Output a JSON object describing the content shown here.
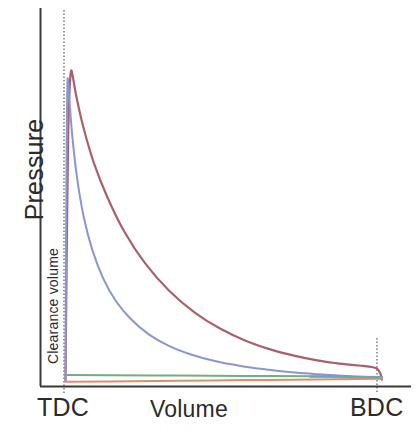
{
  "chart_data": {
    "type": "line",
    "title": "",
    "xlabel": "Volume",
    "ylabel": "Pressure",
    "grid": false,
    "legend": "none",
    "xlim": [
      0,
      1
    ],
    "ylim": [
      0,
      1
    ],
    "x_tick_labels": [
      "TDC",
      "BDC"
    ],
    "x_tick_positions": [
      0.072,
      1.0
    ],
    "y_tick_labels": [],
    "annotations": [
      {
        "text": "Clearance volume",
        "orientation": "vertical",
        "position": "left-inside-near-TDC"
      }
    ],
    "axis_lines": {
      "y_axis_x": 0.0,
      "x_axis_y": 0.0,
      "style": "solid-black"
    },
    "reference_lines": [
      {
        "name": "TDC",
        "type": "vertical-dotted",
        "x": 0.072
      },
      {
        "name": "BDC",
        "type": "vertical-dotted",
        "x": 1.0
      }
    ],
    "series": [
      {
        "name": "expansion-high-pressure",
        "color": "#a8616b",
        "width": 2.2,
        "points": [
          [
            0.072,
            0.015
          ],
          [
            0.074,
            0.24
          ],
          [
            0.077,
            0.52
          ],
          [
            0.08,
            0.74
          ],
          [
            0.084,
            0.86
          ],
          [
            0.088,
            0.91
          ],
          [
            0.093,
            0.895
          ],
          [
            0.105,
            0.83
          ],
          [
            0.125,
            0.745
          ],
          [
            0.155,
            0.645
          ],
          [
            0.195,
            0.545
          ],
          [
            0.245,
            0.445
          ],
          [
            0.305,
            0.355
          ],
          [
            0.375,
            0.276
          ],
          [
            0.45,
            0.213
          ],
          [
            0.525,
            0.166
          ],
          [
            0.6,
            0.131
          ],
          [
            0.675,
            0.105
          ],
          [
            0.745,
            0.087
          ],
          [
            0.81,
            0.074
          ],
          [
            0.865,
            0.066
          ],
          [
            0.91,
            0.061
          ],
          [
            0.945,
            0.058
          ],
          [
            0.97,
            0.055
          ],
          [
            0.985,
            0.05
          ],
          [
            0.993,
            0.04
          ],
          [
            0.998,
            0.028
          ],
          [
            1.0,
            0.018
          ]
        ]
      },
      {
        "name": "expansion-low-pressure",
        "color": "#8a96d0",
        "width": 2.0,
        "points": [
          [
            0.072,
            0.015
          ],
          [
            0.073,
            0.3
          ],
          [
            0.0745,
            0.58
          ],
          [
            0.076,
            0.78
          ],
          [
            0.0775,
            0.875
          ],
          [
            0.079,
            0.885
          ],
          [
            0.083,
            0.83
          ],
          [
            0.092,
            0.72
          ],
          [
            0.106,
            0.6
          ],
          [
            0.125,
            0.49
          ],
          [
            0.15,
            0.395
          ],
          [
            0.182,
            0.312
          ],
          [
            0.22,
            0.245
          ],
          [
            0.265,
            0.192
          ],
          [
            0.315,
            0.15
          ],
          [
            0.375,
            0.116
          ],
          [
            0.44,
            0.091
          ],
          [
            0.51,
            0.072
          ],
          [
            0.585,
            0.058
          ],
          [
            0.66,
            0.048
          ],
          [
            0.735,
            0.04
          ],
          [
            0.8,
            0.035
          ],
          [
            0.86,
            0.031
          ],
          [
            0.91,
            0.028
          ],
          [
            0.955,
            0.026
          ],
          [
            0.985,
            0.024
          ],
          [
            1.0,
            0.022
          ]
        ]
      },
      {
        "name": "intake-line",
        "color": "#6fae86",
        "width": 2.0,
        "points": [
          [
            0.072,
            0.032
          ],
          [
            0.2,
            0.031
          ],
          [
            0.4,
            0.03
          ],
          [
            0.6,
            0.029
          ],
          [
            0.8,
            0.028
          ],
          [
            0.92,
            0.027
          ],
          [
            1.0,
            0.026
          ]
        ]
      },
      {
        "name": "exhaust-line",
        "color": "#e28c6a",
        "width": 2.0,
        "points": [
          [
            0.072,
            0.012
          ],
          [
            0.2,
            0.013
          ],
          [
            0.4,
            0.015
          ],
          [
            0.6,
            0.017
          ],
          [
            0.8,
            0.019
          ],
          [
            0.92,
            0.02
          ],
          [
            1.0,
            0.021
          ]
        ]
      },
      {
        "name": "bdc-transition-segment",
        "color": "#69a8b4",
        "width": 2.2,
        "points": [
          [
            0.79,
            0.027
          ],
          [
            0.86,
            0.027
          ],
          [
            0.92,
            0.026
          ],
          [
            0.96,
            0.026
          ],
          [
            1.0,
            0.025
          ]
        ]
      }
    ]
  },
  "labels": {
    "ylabel": "Pressure",
    "xlabel": "Volume",
    "clearance_volume": "Clearance volume",
    "tdc": "TDC",
    "bdc": "BDC"
  },
  "colors": {
    "axis": "#3a3a3a",
    "dotted_reference": "#555555",
    "text": "#2b2b2b",
    "high_pressure_curve": "#a8616b",
    "low_pressure_curve": "#8a96d0",
    "intake_curve": "#6fae86",
    "exhaust_curve": "#e28c6a",
    "transition_curve": "#69a8b4",
    "background": "#ffffff"
  }
}
